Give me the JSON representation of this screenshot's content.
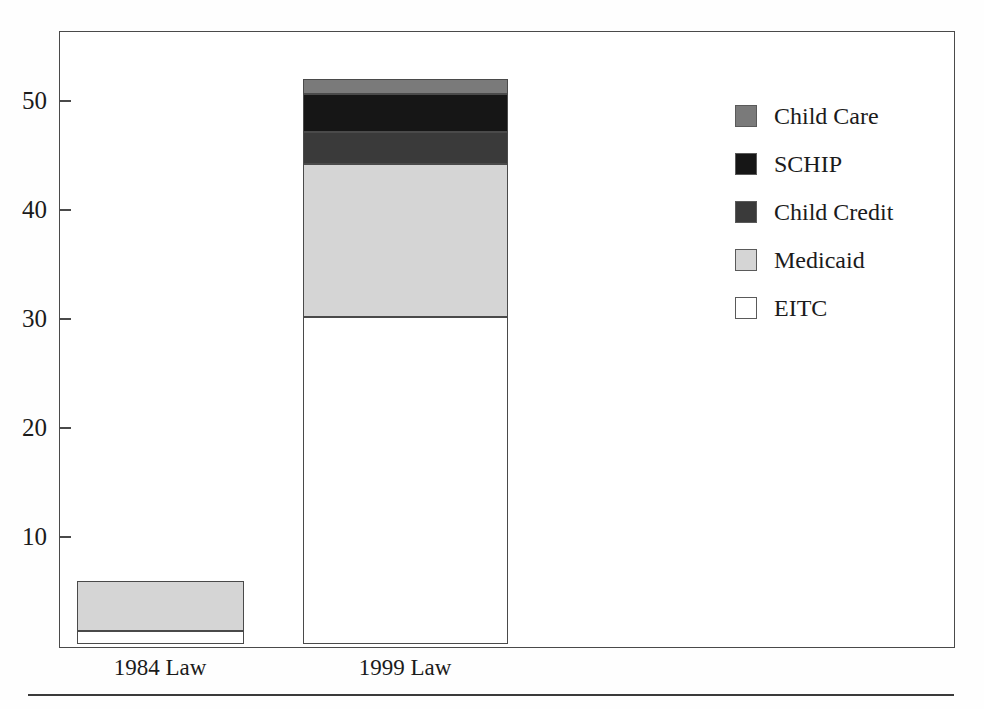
{
  "chart_data": {
    "type": "bar",
    "subtype": "stacked-bar",
    "title": "",
    "xlabel": "",
    "ylabel": "",
    "categories": [
      "1984 Law",
      "1999 Law"
    ],
    "series": [
      {
        "name": "EITC",
        "color": "#ffffff",
        "values": [
          1.2,
          30.0
        ]
      },
      {
        "name": "Medicaid",
        "color": "#d5d5d5",
        "values": [
          4.6,
          14.0
        ]
      },
      {
        "name": "Child Credit",
        "color": "#3a3a3a",
        "values": [
          0,
          3.0
        ]
      },
      {
        "name": "SCHIP",
        "color": "#161616",
        "values": [
          0,
          3.5
        ]
      },
      {
        "name": "Child Care",
        "color": "#7a7a7a",
        "values": [
          0,
          1.3
        ]
      }
    ],
    "totals": [
      5.8,
      51.8
    ],
    "ylim": [
      0,
      56.5
    ],
    "yticks": [
      10,
      20,
      30,
      40,
      50
    ],
    "ytick_labels": [
      "10",
      "20",
      "30",
      "40",
      "50"
    ],
    "grid": false,
    "legend_position": "right",
    "legend_order": [
      "Child Care",
      "SCHIP",
      "Child Credit",
      "Medicaid",
      "EITC"
    ]
  },
  "axis": {
    "ticks": [
      {
        "label": "50",
        "value": 50
      },
      {
        "label": "40",
        "value": 40
      },
      {
        "label": "30",
        "value": 30
      },
      {
        "label": "20",
        "value": 20
      },
      {
        "label": "10",
        "value": 10
      }
    ]
  },
  "x_labels": [
    {
      "label": "1984 Law"
    },
    {
      "label": "1999 Law"
    }
  ],
  "legend": {
    "items": [
      {
        "label": "Child Care",
        "color": "#7a7a7a"
      },
      {
        "label": "SCHIP",
        "color": "#161616"
      },
      {
        "label": "Child Credit",
        "color": "#3a3a3a"
      },
      {
        "label": "Medicaid",
        "color": "#d5d5d5"
      },
      {
        "label": "EITC",
        "color": "#ffffff"
      }
    ]
  }
}
